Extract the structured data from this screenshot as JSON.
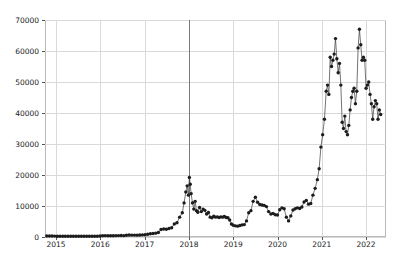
{
  "chart_data": {
    "type": "line",
    "title": "",
    "xlabel": "",
    "ylabel": "",
    "xlim": [
      2014.75,
      2022.45
    ],
    "ylim": [
      0,
      70000
    ],
    "grid": true,
    "legend": null,
    "marker": "circle",
    "marker_color": "#1c1c1c",
    "line_color": "#3a3a3a",
    "grid_color": "#d9d9d9",
    "background": "#ffffff",
    "axis_color": "#b9b9b9",
    "yticks": [
      0,
      10000,
      20000,
      30000,
      40000,
      50000,
      60000,
      70000
    ],
    "ytick_labels": [
      "0",
      "10000",
      "20000",
      "30000",
      "40000",
      "50000",
      "60000",
      "70000"
    ],
    "xticks": [
      2015,
      2016,
      2017,
      2018,
      2019,
      2020,
      2021,
      2022
    ],
    "xtick_labels": [
      "2015",
      "2016",
      "2017",
      "2018",
      "2019",
      "2020",
      "2021",
      "2022"
    ],
    "annotations": [
      {
        "type": "vline",
        "x": 2018.0,
        "color": "#7a7a7a",
        "label": ""
      }
    ],
    "x": [
      2014.79,
      2014.85,
      2014.91,
      2014.97,
      2015.03,
      2015.09,
      2015.15,
      2015.21,
      2015.27,
      2015.33,
      2015.39,
      2015.45,
      2015.51,
      2015.57,
      2015.63,
      2015.69,
      2015.75,
      2015.81,
      2015.87,
      2015.93,
      2015.99,
      2016.05,
      2016.11,
      2016.17,
      2016.23,
      2016.29,
      2016.35,
      2016.41,
      2016.47,
      2016.53,
      2016.59,
      2016.65,
      2016.71,
      2016.77,
      2016.83,
      2016.89,
      2016.95,
      2017.01,
      2017.07,
      2017.13,
      2017.19,
      2017.25,
      2017.31,
      2017.37,
      2017.43,
      2017.49,
      2017.55,
      2017.61,
      2017.67,
      2017.73,
      2017.79,
      2017.85,
      2017.89,
      2017.93,
      2017.96,
      2017.99,
      2018.01,
      2018.03,
      2018.05,
      2018.08,
      2018.11,
      2018.14,
      2018.17,
      2018.2,
      2018.24,
      2018.28,
      2018.32,
      2018.36,
      2018.4,
      2018.44,
      2018.48,
      2018.52,
      2018.56,
      2018.6,
      2018.64,
      2018.68,
      2018.72,
      2018.76,
      2018.8,
      2018.84,
      2018.88,
      2018.92,
      2018.96,
      2019.0,
      2019.05,
      2019.1,
      2019.15,
      2019.2,
      2019.25,
      2019.3,
      2019.35,
      2019.4,
      2019.45,
      2019.5,
      2019.55,
      2019.6,
      2019.65,
      2019.7,
      2019.75,
      2019.8,
      2019.85,
      2019.9,
      2019.95,
      2020.0,
      2020.05,
      2020.1,
      2020.15,
      2020.2,
      2020.25,
      2020.3,
      2020.35,
      2020.4,
      2020.45,
      2020.5,
      2020.55,
      2020.6,
      2020.65,
      2020.7,
      2020.75,
      2020.8,
      2020.85,
      2020.9,
      2020.94,
      2020.98,
      2021.02,
      2021.06,
      2021.1,
      2021.13,
      2021.16,
      2021.19,
      2021.22,
      2021.25,
      2021.28,
      2021.31,
      2021.34,
      2021.37,
      2021.4,
      2021.43,
      2021.46,
      2021.49,
      2021.52,
      2021.55,
      2021.58,
      2021.61,
      2021.64,
      2021.67,
      2021.7,
      2021.73,
      2021.76,
      2021.79,
      2021.82,
      2021.85,
      2021.88,
      2021.91,
      2021.94,
      2021.97,
      2022.0,
      2022.03,
      2022.06,
      2022.09,
      2022.12,
      2022.15,
      2022.18,
      2022.21,
      2022.24,
      2022.27,
      2022.3,
      2022.33
    ],
    "values": [
      330,
      320,
      310,
      290,
      250,
      230,
      240,
      235,
      225,
      240,
      230,
      235,
      245,
      250,
      260,
      255,
      240,
      245,
      250,
      265,
      310,
      380,
      430,
      420,
      400,
      420,
      430,
      450,
      460,
      440,
      580,
      650,
      620,
      610,
      600,
      630,
      700,
      750,
      900,
      1050,
      1150,
      1250,
      1450,
      2400,
      2600,
      2500,
      2750,
      3000,
      4200,
      4600,
      6400,
      7800,
      11000,
      14500,
      16500,
      13500,
      19200,
      17000,
      14000,
      11000,
      9000,
      11500,
      8500,
      8000,
      9500,
      8200,
      9000,
      8600,
      7400,
      7900,
      6400,
      6200,
      6700,
      6400,
      6500,
      6300,
      6500,
      6400,
      6600,
      6300,
      6200,
      5500,
      4200,
      3800,
      3600,
      3500,
      3700,
      3900,
      4000,
      5200,
      7800,
      8500,
      11500,
      12800,
      11200,
      10500,
      10300,
      10200,
      9800,
      8200,
      7400,
      7600,
      7200,
      7100,
      8800,
      9400,
      9100,
      6400,
      5200,
      6800,
      8700,
      9100,
      9400,
      9200,
      9700,
      11300,
      11800,
      10600,
      10800,
      13500,
      15700,
      18500,
      22000,
      29000,
      33000,
      38000,
      47000,
      49000,
      46000,
      58000,
      55000,
      57000,
      59000,
      64000,
      57500,
      53000,
      56000,
      49000,
      37000,
      35000,
      39000,
      34000,
      33000,
      36000,
      41000,
      45000,
      47000,
      48000,
      43000,
      47000,
      61000,
      67000,
      62000,
      57000,
      58000,
      57000,
      48000,
      49000,
      50000,
      46000,
      43000,
      38000,
      42000,
      44000,
      43000,
      38000,
      41000,
      39500
    ]
  }
}
